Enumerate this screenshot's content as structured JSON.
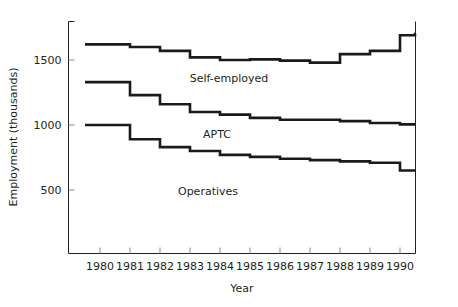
{
  "chart_data": {
    "type": "line",
    "subtype": "step",
    "title": "",
    "xlabel": "Year",
    "ylabel": "Employment (thousands)",
    "xlim": [
      1979.5,
      1990.5
    ],
    "ylim": [
      0,
      1800
    ],
    "xticks": [
      1980,
      1981,
      1982,
      1983,
      1984,
      1985,
      1986,
      1987,
      1988,
      1989,
      1990
    ],
    "xtick_labels": [
      "1980",
      "1981",
      "1982",
      "1983",
      "1984",
      "1985",
      "1986",
      "1987",
      "1988",
      "1989",
      "1990"
    ],
    "yticks": [
      500,
      1000,
      1500
    ],
    "ytick_labels": [
      "500",
      "1000",
      "1500"
    ],
    "grid": false,
    "legend": "inline-annotations",
    "x": [
      1979.5,
      1980,
      1981,
      1982,
      1983,
      1984,
      1985,
      1986,
      1987,
      1988,
      1989,
      1990,
      1990.5
    ],
    "series": [
      {
        "name": "Self-employed",
        "label": "Self-employed",
        "color": "#1a1a1a",
        "values": [
          1620,
          1620,
          1600,
          1570,
          1520,
          1500,
          1505,
          1495,
          1480,
          1545,
          1570,
          1690,
          1700
        ]
      },
      {
        "name": "APTC",
        "label": "APTC",
        "color": "#1a1a1a",
        "values": [
          1330,
          1330,
          1230,
          1160,
          1100,
          1080,
          1055,
          1040,
          1040,
          1030,
          1015,
          1005,
          1005
        ]
      },
      {
        "name": "Operatives",
        "label": "Operatives",
        "color": "#1a1a1a",
        "values": [
          1000,
          1000,
          890,
          830,
          800,
          770,
          755,
          740,
          730,
          720,
          710,
          650,
          650
        ]
      }
    ],
    "annotations": [
      {
        "text": "Self-employed",
        "x": 1984.3,
        "y": 1330
      },
      {
        "text": "APTC",
        "x": 1983.9,
        "y": 900
      },
      {
        "text": "Operatives",
        "x": 1983.6,
        "y": 460
      }
    ]
  }
}
